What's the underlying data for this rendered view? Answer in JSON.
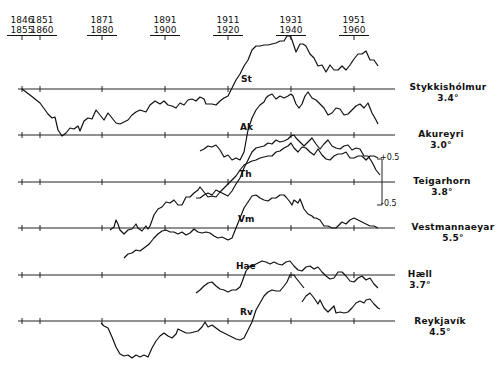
{
  "chart_data": {
    "type": "line",
    "title": "",
    "xlabel": "",
    "ylabel": "",
    "x_ticks": [
      {
        "line1": "1846",
        "line2": "1855",
        "x": 22
      },
      {
        "line1": "1851",
        "line2": "1860",
        "x": 40
      },
      {
        "line1": "1871",
        "line2": "1880",
        "x": 102
      },
      {
        "line1": "1891",
        "line2": "1900",
        "x": 165
      },
      {
        "line1": "1911",
        "line2": "1920",
        "x": 228
      },
      {
        "line1": "1931",
        "line2": "1940",
        "x": 291
      },
      {
        "line1": "1951",
        "line2": "1960",
        "x": 354
      }
    ],
    "scale": {
      "plus": "+0.5",
      "minus": "-0.5",
      "station": "Teigarhorn"
    },
    "series": [
      {
        "name": "Stykkishólmur",
        "abbr": "St",
        "mean": "3.4°",
        "baseline_y": 89,
        "points": "22,89 30,95 40,103 48,114 52,118 55,117 58,130 62,136 66,133 70,128 74,129 78,126 80,131 84,121 88,118 92,119 96,110 100,115 104,120 108,113 112,118 116,123 120,124 124,122 128,120 132,115 136,112 140,110 146,112 150,105 155,101 160,104 164,101 168,105 172,106 176,108 180,103 184,105 188,100 192,99 196,101 200,97 204,99 206,104 212,104 216,105 220,101 224,98 228,96 232,88 236,80 240,74 244,66 248,60 252,50 256,46 260,46 264,45 268,45 272,44 276,43 280,41 284,41 287,36 290,36 292,40 296,52 300,44 303,44 306,46 310,54 314,58 318,66 322,65 326,72 330,65 334,70 338,70 342,66 346,70 350,65 354,59 358,54 362,54 366,51 370,60 374,60 378,66"
      },
      {
        "name": "Akureyri",
        "abbr": "Ak",
        "mean": "3.0°",
        "baseline_y": 135,
        "points": "200,151 204,149 208,146 212,147 216,145 220,150 224,157 228,155 232,160 236,158 240,160 244,152 248,130 252,118 256,110 260,105 264,102 266,98 268,96 272,94 276,99 280,96 284,98 288,96 291,94 293,96 296,104 299,108 302,104 305,96 308,92 312,98 316,100 320,104 324,108 328,115 332,113 336,108 340,109 344,115 348,114 352,110 356,106 360,104 364,108 368,103 372,113 376,120 378,124"
      },
      {
        "name": "Teigarhorn",
        "abbr": "Th",
        "mean": "3.8°",
        "baseline_y": 182,
        "points": "196,198 200,198 204,195 208,193 212,195 216,190 220,192 224,194 228,196 232,191 236,184 240,178 244,168 248,160 252,152 256,148 260,147 264,146 268,143 272,144 276,140 280,142 284,141 288,139 291,136 294,135 296,138 300,142 304,146 308,142 312,138 316,144 320,149 324,144 328,140 332,146 336,148 340,149 344,146 348,145 352,150 356,148 360,149 364,156 368,156 372,162 376,170 380,175"
      },
      {
        "name": "Vestmannaeyjar",
        "abbr": "Vm",
        "mean": "5.5°",
        "baseline_y": 228,
        "points": "110,230 114,227 116,220 118,224 120,230 124,234 128,230 132,229 136,224 138,228 142,231 146,226 148,229 150,226 154,215 158,209 162,207 166,202 170,203 174,200 178,205 182,205 186,197 190,197 194,193 198,190 200,187 204,192 208,197 212,196 216,197 220,192 224,188 228,184 232,180 236,176 240,170 244,165 248,163 252,161 256,160 260,158 264,157 268,156 272,156 276,152 280,151 284,148 288,146 291,143 294,148 298,152 302,147 306,148 310,152 314,155 318,149 322,155 326,159 330,160 334,156 338,154 342,154 346,152 350,158 354,158 358,156 362,156 366,160 370,156 374,156 378,158"
      },
      {
        "name": "Hæll",
        "abbr": "Hae",
        "mean": "3.7°",
        "baseline_y": 275,
        "points": "124,258 128,254 132,253 136,250 140,251 144,248 148,245 150,243 154,238 158,234 162,231 166,230 170,232 174,232 178,234 182,232 186,235 190,233 194,229 198,232 202,233 206,232 210,233 214,236 218,238 222,237 228,240 232,238 236,228 240,218 244,208 248,202 252,196 256,195 260,198 264,200 268,201 272,198 276,198 280,195 284,195 286,197 290,202 292,205 294,200 298,203 300,199 304,209 308,214 312,216 314,218 316,218 320,220 324,226 328,226 332,228 336,228 338,226 342,222 346,224 350,220 354,218 358,220 362,222 366,224 370,226 374,226 378,228"
      },
      {
        "name": "Hæll (upper)",
        "abbr": "",
        "mean": "",
        "baseline_y": 275,
        "points": "196,293 200,290 204,286 208,283 212,282 216,286 220,289 224,290 228,292 232,290 236,290 240,287 242,282 246,271 250,266 254,265 258,263 262,261 266,262 270,264 274,262 278,264 282,265 286,262 290,261 294,266 298,270 302,271 306,267 310,266 314,269 318,267 322,272 326,276 330,279 334,278 338,272 342,272 346,276 350,281 354,282 358,278 362,276 366,280 370,278 374,284 378,288"
      },
      {
        "name": "Reykjavík",
        "abbr": "Rv",
        "mean": "4.5°",
        "baseline_y": 321,
        "points": "101,323 104,326 108,328 112,337 116,347 120,354 124,356 128,355 132,358 136,355 140,357 144,355 148,357 152,348 156,341 160,336 164,333 168,336 172,338 176,334 178,329 182,331 186,333 190,333 194,332 198,331 202,327 205,322 208,327 212,325 216,328 220,331 224,333 228,335 232,337 236,339 240,340 244,338 248,330 252,322 256,310 260,303 264,296 268,292 272,290 276,291 280,291 284,286 287,282 290,275 294,275 296,278 300,283 304,288"
      },
      {
        "name": "Reykjavík (upper)",
        "abbr": "",
        "mean": "",
        "baseline_y": 321,
        "points": "302,302 306,296 310,293 314,298 318,304 320,300 324,308 328,312 330,310 334,306 336,313 340,312 344,313 348,312 352,308 356,303 360,301 364,303 366,300 370,299 374,304 378,308 380,309"
      }
    ],
    "hline_x": [
      18,
      395
    ]
  },
  "ticks": {
    "t0": {
      "a": "1846",
      "b": "1855"
    },
    "t1": {
      "a": "1851",
      "b": "1860"
    },
    "t2": {
      "a": "1871",
      "b": "1880"
    },
    "t3": {
      "a": "1891",
      "b": "1900"
    },
    "t4": {
      "a": "1911",
      "b": "1920"
    },
    "t5": {
      "a": "1931",
      "b": "1940"
    },
    "t6": {
      "a": "1951",
      "b": "1960"
    }
  },
  "stations": {
    "st": {
      "name": "Stykkishólmur",
      "temp": "3.4°",
      "abbr": "St"
    },
    "ak": {
      "name": "Akureyri",
      "temp": "3.0°",
      "abbr": "Ak"
    },
    "th": {
      "name": "Teigarhorn",
      "temp": "3.8°",
      "abbr": "Th"
    },
    "vm": {
      "name": "Vestmannaeyar",
      "temp": "5.5°",
      "abbr": "Vm"
    },
    "hae": {
      "name": "Hæll",
      "temp": "3.7°",
      "abbr": "Hae"
    },
    "rv": {
      "name": "Reykjavík",
      "temp": "4.5°",
      "abbr": "Rv"
    }
  },
  "scale": {
    "plus": "+0.5",
    "minus": "-0.5"
  }
}
